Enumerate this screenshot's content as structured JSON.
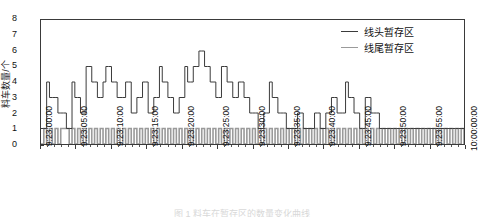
{
  "figure": {
    "ylabel": "料车数量/个",
    "caption": "图 1   料车在暂存区的数量变化曲线"
  },
  "legend": {
    "position": "top-right",
    "items": [
      {
        "label": "线头暂存区",
        "color": "#3b3b3b",
        "name": "series-head-buffer"
      },
      {
        "label": "线尾暂存区",
        "color": "#9a9a9a",
        "name": "series-tail-buffer"
      }
    ]
  },
  "axes": {
    "y": {
      "ticks": [
        "0",
        "1",
        "2",
        "3",
        "4",
        "5",
        "6",
        "7",
        "8"
      ],
      "min": 0,
      "max": 8,
      "minor_per_major": 5
    },
    "x": {
      "ticks": [
        "9:23:00:00",
        "9:23:05:00",
        "9:23:10:00",
        "9:23:15:00",
        "9:23:20:00",
        "9:23:25:00",
        "9:23:30:00",
        "9:23:35:00",
        "9:23:40:00",
        "9:23:45:00",
        "9:23:50:00",
        "9:23:55:00",
        "10:00:00:00"
      ],
      "min": 0,
      "max": 60,
      "minor_per_major": 5
    }
  },
  "chart_data": {
    "type": "line",
    "title": "",
    "xlabel": "",
    "ylabel": "料车数量/个",
    "xlim": [
      0,
      60
    ],
    "ylim": [
      0,
      8
    ],
    "grid": false,
    "drawstyle": "steps-post",
    "legend_position": "top-right",
    "x_tick_labels": [
      "9:23:00:00",
      "9:23:05:00",
      "9:23:10:00",
      "9:23:15:00",
      "9:23:20:00",
      "9:23:25:00",
      "9:23:30:00",
      "9:23:35:00",
      "9:23:40:00",
      "9:23:45:00",
      "9:23:50:00",
      "9:23:55:00",
      "10:00:00:00"
    ],
    "x_tick_positions": [
      0,
      5,
      10,
      15,
      20,
      25,
      30,
      35,
      40,
      45,
      50,
      55,
      60
    ],
    "x": [
      0.0,
      0.4,
      0.8,
      1.2,
      1.6,
      2.0,
      2.4,
      2.8,
      3.2,
      3.6,
      4.0,
      4.4,
      4.8,
      5.2,
      5.6,
      6.0,
      6.4,
      6.8,
      7.2,
      7.6,
      8.0,
      8.4,
      8.8,
      9.2,
      9.6,
      10.0,
      10.4,
      10.8,
      11.2,
      11.6,
      12.0,
      12.4,
      12.8,
      13.2,
      13.6,
      14.0,
      14.4,
      14.8,
      15.2,
      15.6,
      16.0,
      16.4,
      16.8,
      17.2,
      17.6,
      18.0,
      18.4,
      18.8,
      19.2,
      19.6,
      20.0,
      20.4,
      20.8,
      21.2,
      21.6,
      22.0,
      22.4,
      22.8,
      23.2,
      23.6,
      24.0,
      24.4,
      24.8,
      25.2,
      25.6,
      26.0,
      26.4,
      26.8,
      27.2,
      27.6,
      28.0,
      28.4,
      28.8,
      29.2,
      29.6,
      30.0,
      30.4,
      30.8,
      31.2,
      31.6,
      32.0,
      32.4,
      32.8,
      33.2,
      33.6,
      34.0,
      34.4,
      34.8,
      35.2,
      35.6,
      36.0,
      36.4,
      36.8,
      37.2,
      37.6,
      38.0,
      38.4,
      38.8,
      39.2,
      39.6,
      40.0,
      40.4,
      40.8,
      41.2,
      41.6,
      42.0,
      42.4,
      42.8,
      43.2,
      43.6,
      44.0,
      44.4,
      44.8,
      45.2,
      45.6,
      46.0,
      46.4,
      46.8,
      47.2,
      47.6,
      48.0,
      48.4,
      48.8,
      49.2,
      49.6,
      50.0,
      50.4,
      50.8,
      51.2,
      51.6,
      52.0,
      52.4,
      52.8,
      53.2,
      53.6,
      54.0,
      54.4,
      54.8,
      55.2,
      55.6,
      56.0,
      56.4,
      56.8,
      57.2,
      57.6,
      58.0,
      58.4,
      58.8,
      59.2,
      59.6,
      60.0
    ],
    "series": [
      {
        "name": "线头暂存区",
        "color": "#3b3b3b",
        "values": [
          1,
          1,
          4,
          3,
          3,
          3,
          2,
          2,
          2,
          1,
          1,
          4,
          3,
          3,
          2,
          2,
          5,
          5,
          4,
          4,
          3,
          3,
          4,
          5,
          5,
          4,
          4,
          3,
          3,
          3,
          4,
          4,
          2,
          2,
          3,
          3,
          4,
          4,
          2,
          2,
          3,
          3,
          5,
          4,
          4,
          3,
          3,
          2,
          2,
          3,
          3,
          5,
          4,
          4,
          5,
          5,
          6,
          6,
          5,
          5,
          4,
          4,
          3,
          3,
          5,
          5,
          4,
          4,
          3,
          3,
          4,
          4,
          3,
          3,
          2,
          2,
          2,
          1,
          1,
          2,
          2,
          4,
          3,
          3,
          2,
          2,
          2,
          1,
          1,
          1,
          1,
          2,
          2,
          1,
          1,
          1,
          1,
          2,
          2,
          1,
          1,
          2,
          2,
          3,
          3,
          2,
          2,
          2,
          4,
          3,
          3,
          2,
          2,
          1,
          1,
          3,
          3,
          2,
          2,
          2,
          1,
          1,
          1,
          1,
          1,
          1,
          1,
          1,
          1,
          1,
          1,
          1,
          1,
          1,
          1,
          1,
          1,
          1,
          1,
          1,
          1,
          1,
          1,
          1,
          1,
          1,
          1,
          1,
          1,
          1,
          1
        ]
      },
      {
        "name": "线尾暂存区",
        "color": "#9a9a9a",
        "values": [
          0,
          1,
          0,
          1,
          0,
          1,
          0,
          1,
          1,
          1,
          0,
          1,
          0,
          1,
          0,
          1,
          0,
          1,
          0,
          1,
          0,
          1,
          0,
          1,
          0,
          1,
          0,
          1,
          0,
          1,
          0,
          1,
          0,
          1,
          0,
          1,
          0,
          1,
          0,
          1,
          0,
          1,
          0,
          1,
          0,
          1,
          0,
          1,
          0,
          1,
          0,
          1,
          0,
          1,
          0,
          1,
          0,
          1,
          0,
          1,
          0,
          1,
          0,
          1,
          0,
          1,
          0,
          1,
          0,
          1,
          0,
          1,
          0,
          1,
          0,
          1,
          0,
          1,
          0,
          1,
          0,
          1,
          0,
          1,
          0,
          1,
          0,
          1,
          0,
          1,
          0,
          1,
          0,
          1,
          0,
          1,
          0,
          1,
          0,
          1,
          0,
          1,
          0,
          1,
          0,
          1,
          0,
          1,
          0,
          1,
          0,
          1,
          0,
          1,
          0,
          1,
          0,
          1,
          0,
          1,
          0,
          1,
          0,
          1,
          0,
          1,
          0,
          1,
          0,
          1,
          0,
          1,
          0,
          1,
          0,
          1,
          0,
          1,
          0,
          1,
          0,
          1,
          0,
          1,
          0,
          1,
          0,
          1,
          0,
          1,
          0
        ]
      }
    ]
  }
}
